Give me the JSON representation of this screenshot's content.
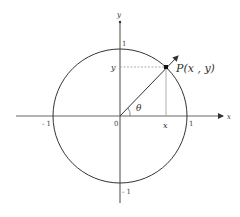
{
  "diagram": {
    "type": "unit-circle",
    "axes": {
      "x_label": "x",
      "y_label": "y",
      "origin_label": "0"
    },
    "ticks": {
      "x_pos": "1",
      "x_neg": "- 1",
      "y_pos": "1",
      "y_neg": "- 1"
    },
    "point": {
      "label": "P(x , y)",
      "x_proj_label": "x",
      "y_proj_label": "y"
    },
    "angle_label": "θ",
    "colors": {
      "stroke": "#333333",
      "axis": "#666666",
      "guide": "#999999"
    }
  }
}
